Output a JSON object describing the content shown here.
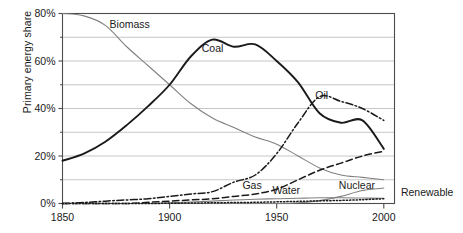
{
  "chart_data": {
    "type": "line",
    "title": "",
    "xlabel": "",
    "ylabel": "Primary energy share",
    "xlim": [
      1850,
      2005
    ],
    "ylim": [
      0,
      80
    ],
    "grid": true,
    "grid_step": 10,
    "legend_position": "inline-annotations",
    "xticks": [
      "1850",
      "1900",
      "1950",
      "2000"
    ],
    "xtick_values": [
      1850,
      1900,
      1950,
      2000
    ],
    "yticks": [
      "0%",
      "20%",
      "40%",
      "60%",
      "80%"
    ],
    "ytick_values": [
      0,
      20,
      40,
      60,
      80
    ],
    "x": [
      1850,
      1860,
      1870,
      1880,
      1890,
      1900,
      1910,
      1920,
      1930,
      1940,
      1950,
      1960,
      1970,
      1980,
      1990,
      2000
    ],
    "series": [
      {
        "name": "Biomass",
        "style": "solid-thin-gray",
        "color": "#808080",
        "label_x": 1872,
        "label_y": 74,
        "values": [
          80,
          79,
          75,
          66,
          58,
          50,
          42,
          36,
          32,
          28,
          25,
          20,
          15,
          12,
          11,
          10
        ]
      },
      {
        "name": "Coal",
        "style": "solid-thick-black",
        "color": "#1a1a1a",
        "label_x": 1915,
        "label_y": 64,
        "values": [
          18,
          21,
          26,
          33,
          41,
          50,
          62,
          69,
          66,
          67,
          60,
          51,
          38,
          34,
          35,
          23
        ]
      },
      {
        "name": "Oil",
        "style": "dash-dot",
        "color": "#1a1a1a",
        "label_x": 1968,
        "label_y": 44,
        "values": [
          0,
          0.4,
          1,
          1.5,
          2,
          3,
          4,
          5,
          9,
          12,
          21,
          34,
          45,
          43,
          40,
          35
        ]
      },
      {
        "name": "Gas",
        "style": "dashed",
        "color": "#1a1a1a",
        "label_x": 1934,
        "label_y": 6,
        "values": [
          0,
          0,
          0,
          0,
          0.5,
          1,
          1.5,
          2,
          3,
          4,
          6,
          10,
          14,
          17,
          20,
          22
        ]
      },
      {
        "name": "Water",
        "style": "solid-thin-gray",
        "color": "#808080",
        "label_x": 1948,
        "label_y": 4,
        "values": [
          0,
          0,
          0,
          0,
          0,
          0.3,
          0.6,
          1,
          1.5,
          1.8,
          2,
          2.2,
          2.4,
          2.4,
          2.3,
          2.2
        ]
      },
      {
        "name": "Nuclear",
        "style": "solid-thin-gray",
        "color": "#808080",
        "label_x": 1979,
        "label_y": 6,
        "values": [
          0,
          0,
          0,
          0,
          0,
          0,
          0,
          0,
          0,
          0,
          0,
          0.3,
          1.2,
          3,
          5.5,
          6.5
        ]
      },
      {
        "name": "Renewable",
        "style": "dotted",
        "color": "#1a1a1a",
        "label_x": 2008,
        "label_y": 3,
        "values": [
          0,
          0,
          0,
          0,
          0,
          0.1,
          0.2,
          0.3,
          0.4,
          0.5,
          0.7,
          0.9,
          1.1,
          1.3,
          1.6,
          2.0
        ]
      }
    ]
  },
  "axis": {
    "frame_color": "#4d4d4d",
    "grid_color": "#bfbfbf"
  }
}
